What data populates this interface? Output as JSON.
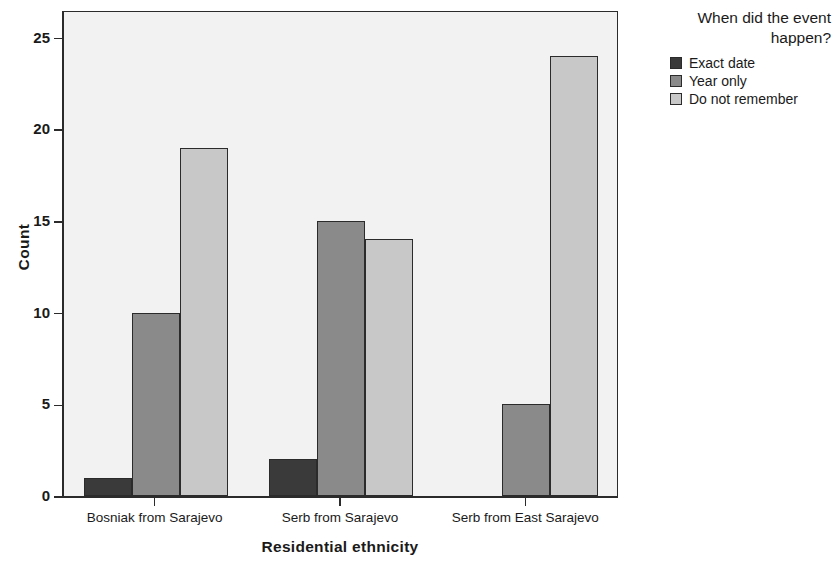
{
  "chart_data": {
    "type": "bar",
    "title": "",
    "subtitle": "",
    "xlabel": "Residential ethnicity",
    "ylabel": "Count",
    "categories": [
      "Bosniak from Sarajevo",
      "Serb from Sarajevo",
      "Serb from East Sarajevo"
    ],
    "series": [
      {
        "name": "Exact date",
        "values": [
          1,
          2,
          0
        ],
        "color": "#3a3a3a"
      },
      {
        "name": "Year only",
        "values": [
          10,
          15,
          5
        ],
        "color": "#8a8a8a"
      },
      {
        "name": "Do not remember",
        "values": [
          19,
          14,
          24
        ],
        "color": "#c8c8c8"
      }
    ],
    "ylim": [
      0,
      26.5
    ],
    "yticks": [
      0,
      5,
      10,
      15,
      20,
      25
    ],
    "ytick_labels": [
      "0",
      "5",
      "10",
      "15",
      "20",
      "25"
    ],
    "grid": false,
    "legend_position": "right",
    "legend_title": "When did the event happen?",
    "plot_background": "#f2f2f2",
    "axis_color": "#2b2b2b"
  },
  "legend": {
    "title_line1": "When did the event",
    "title_line2": "happen?"
  }
}
